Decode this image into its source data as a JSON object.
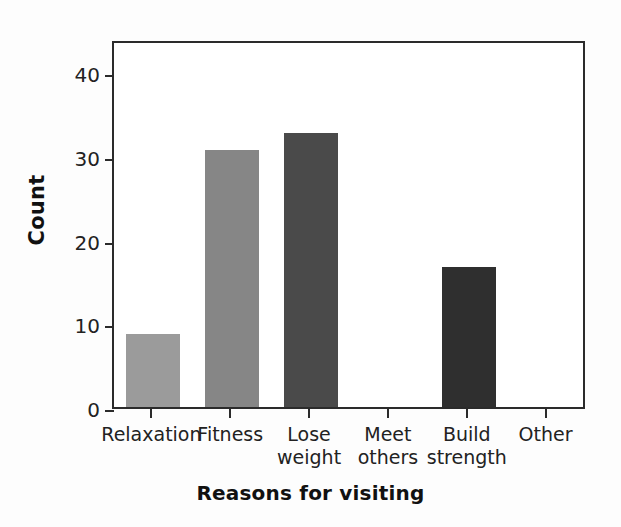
{
  "chart_data": {
    "type": "bar",
    "title": "",
    "xlabel": "Reasons for visiting",
    "ylabel": "Count",
    "categories": [
      "Relaxation",
      "Fitness",
      "Lose weight",
      "Meet others",
      "Build strength",
      "Other"
    ],
    "values": [
      9,
      31,
      33,
      0,
      17,
      0
    ],
    "bar_colors": [
      "#9b9b9b",
      "#868686",
      "#4a4a4a",
      "#333333",
      "#2f2f2f",
      "#333333"
    ],
    "ylim": [
      0,
      44
    ],
    "yticks": [
      0,
      10,
      20,
      30,
      40
    ],
    "ytick_labels": [
      "0",
      "10",
      "20",
      "30",
      "40"
    ],
    "grid": false,
    "legend": null,
    "axis_color": "#2b2b2b",
    "background": "#ffffff"
  },
  "axes": {
    "y_title": "Count",
    "x_title": "Reasons for visiting"
  },
  "x_tick_labels": [
    "Relaxation",
    "Fitness",
    "Lose\nweight",
    "Meet\nothers",
    "Build\nstrength",
    "Other"
  ]
}
